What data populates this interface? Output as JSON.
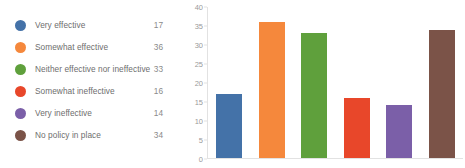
{
  "legend": {
    "items": [
      {
        "label": "Very effective",
        "value": "17",
        "color": "#4472A8",
        "icon": "legend-dot-icon"
      },
      {
        "label": "Somewhat effective",
        "value": "36",
        "color": "#F5883C",
        "icon": "legend-dot-icon"
      },
      {
        "label": "Neither effective nor ineffective",
        "value": "33",
        "color": "#5FA03C",
        "icon": "legend-dot-icon"
      },
      {
        "label": "Somewhat ineffective",
        "value": "16",
        "color": "#E8472A",
        "icon": "legend-dot-icon"
      },
      {
        "label": "Very ineffective",
        "value": "14",
        "color": "#7B5FA8",
        "icon": "legend-dot-icon"
      },
      {
        "label": "No policy in place",
        "value": "34",
        "color": "#7B5348",
        "icon": "legend-dot-icon"
      }
    ]
  },
  "chart_data": {
    "type": "bar",
    "title": "",
    "xlabel": "",
    "ylabel": "",
    "ylim": [
      0,
      40
    ],
    "yticks": [
      0,
      5,
      10,
      15,
      20,
      25,
      30,
      35,
      40
    ],
    "ytick_labels": [
      "0",
      "5",
      "10",
      "15",
      "20",
      "25",
      "30",
      "35",
      "40"
    ],
    "grid": false,
    "legend_position": "left",
    "categories": [
      "Very effective",
      "Somewhat effective",
      "Neither effective nor ineffective",
      "Somewhat ineffective",
      "Very ineffective",
      "No policy in place"
    ],
    "values": [
      17,
      36,
      33,
      16,
      14,
      34
    ],
    "colors": [
      "#4472A8",
      "#F5883C",
      "#5FA03C",
      "#E8472A",
      "#7B5FA8",
      "#7B5348"
    ]
  }
}
